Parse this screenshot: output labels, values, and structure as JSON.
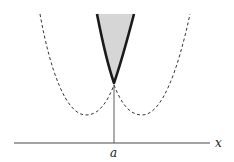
{
  "figure": {
    "axis_label_x": "x",
    "point_label": "a",
    "colors": {
      "background": "#ffffff",
      "ink": "#1a1a1a",
      "dashed": "#333333",
      "shade": "#d4d4d4"
    },
    "elements": [
      {
        "name": "bold-curve",
        "description": "upper envelope, thick solid line with shaded interior above vertex at a"
      },
      {
        "name": "left-dashed-curve",
        "description": "dashed parabola with minimum left of a"
      },
      {
        "name": "right-dashed-curve",
        "description": "dashed parabola with minimum right of a"
      },
      {
        "name": "vertical-line",
        "description": "thin vertical line from vertex down to x-axis at a"
      },
      {
        "name": "x-axis",
        "description": "horizontal axis"
      }
    ]
  }
}
